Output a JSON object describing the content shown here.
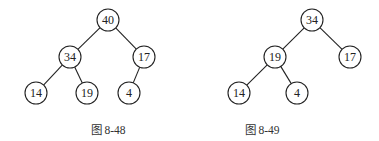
{
  "figures": [
    {
      "caption": "图 8-48",
      "caption_pos": {
        "x": 108,
        "y": 121
      },
      "nodes": [
        {
          "id": "a40",
          "label": "40",
          "x": 108,
          "y": 20
        },
        {
          "id": "a34",
          "label": "34",
          "x": 70,
          "y": 57
        },
        {
          "id": "a17",
          "label": "17",
          "x": 144,
          "y": 57
        },
        {
          "id": "a14",
          "label": "14",
          "x": 36,
          "y": 93
        },
        {
          "id": "a19",
          "label": "19",
          "x": 87,
          "y": 93
        },
        {
          "id": "a4",
          "label": "4",
          "x": 129,
          "y": 93
        }
      ],
      "edges": [
        [
          "a40",
          "a34"
        ],
        [
          "a40",
          "a17"
        ],
        [
          "a34",
          "a14"
        ],
        [
          "a34",
          "a19"
        ],
        [
          "a17",
          "a4"
        ]
      ]
    },
    {
      "caption": "图 8-49",
      "caption_pos": {
        "x": 262,
        "y": 121
      },
      "nodes": [
        {
          "id": "b34",
          "label": "34",
          "x": 312,
          "y": 20
        },
        {
          "id": "b19",
          "label": "19",
          "x": 275,
          "y": 57
        },
        {
          "id": "b17",
          "label": "17",
          "x": 350,
          "y": 57
        },
        {
          "id": "b14",
          "label": "14",
          "x": 239,
          "y": 93
        },
        {
          "id": "b4",
          "label": "4",
          "x": 297,
          "y": 93
        }
      ],
      "edges": [
        [
          "b34",
          "b19"
        ],
        [
          "b34",
          "b17"
        ],
        [
          "b19",
          "b14"
        ],
        [
          "b19",
          "b4"
        ]
      ]
    }
  ],
  "node_radius": 11
}
